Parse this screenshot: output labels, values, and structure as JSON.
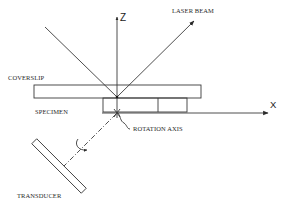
{
  "diagram": {
    "axes": {
      "z_label": "Z",
      "x_label": "X"
    },
    "labels": {
      "laser_beam": "LASER BEAM",
      "coverslip": "COVERSLIP",
      "specimen": "SPECIMEN",
      "rotation_axis": "ROTATION AXIS",
      "transducer": "TRANSDUCER"
    },
    "colors": {
      "line": "#3a3a3a",
      "text": "#2a2a2a",
      "background": "#ffffff"
    }
  }
}
